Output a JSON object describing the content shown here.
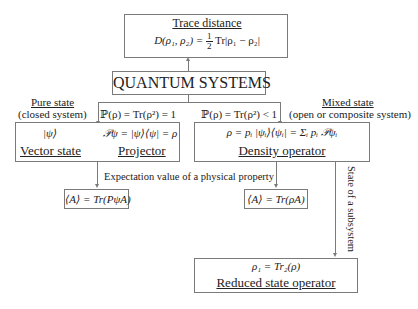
{
  "trace_distance": {
    "title": "Trace distance",
    "lhs": "D(ρ₁, ρ₂) =",
    "frac_num": "1",
    "frac_den": "2",
    "rhs": "Tr|ρ₁ − ρ₂|"
  },
  "root": {
    "label": "QUANTUM SYSTEMS"
  },
  "pure": {
    "title": "Pure state",
    "subtitle": "(closed system)",
    "condition": "ℙ(ρ) = Tr(ρ²) = 1",
    "ket": "|ψ⟩",
    "projector_formula": "𝒫ψ = |ψ⟩⟨ψ| = ρ",
    "vector_label": "Vector state",
    "projector_label": "Projector",
    "expectation": "⟨A⟩ = Tr(PψA)"
  },
  "mixed": {
    "title": "Mixed state",
    "subtitle": "(open or composite system)",
    "condition": "ℙ(ρ) = Tr(ρ²) < 1",
    "density_formula": "ρ = pᵢ |ψᵢ⟩⟨ψᵢ| = Σᵢ pᵢ 𝒫ψᵢ",
    "density_label": "Density operator",
    "expectation": "⟨A⟩ = Tr(ρA)"
  },
  "expectation_label": "Expectation value of a physical property",
  "subsystem_label": "State of a subsystem",
  "reduced": {
    "formula": "ρ₁ = Tr₂(ρ)",
    "label": "Reduced state operator"
  }
}
